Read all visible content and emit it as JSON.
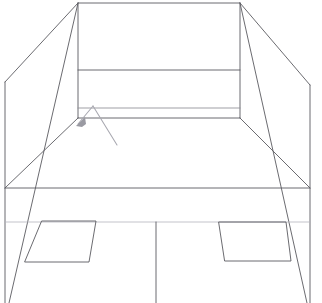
{
  "document": {
    "title": "Perspective Line Drawing",
    "kind": "line-art wireframe sketch",
    "subject": "interior room perspective box",
    "background_color": "#ffffff",
    "line_color": "#5a5a60",
    "faint_line_color": "#b4b4bc",
    "marker_color": "#9a9aa2",
    "canvas": {
      "width": 322,
      "height": 303
    }
  },
  "geometry": {
    "back_wall": {
      "name": "back-wall-rectangle",
      "x1": 78,
      "y1": 3,
      "x2": 240,
      "y2": 118,
      "horizontal_dividers_y": [
        70,
        108,
        118
      ]
    },
    "vanishing_lines": {
      "from_top_left_vertex": {
        "x": 78,
        "y": 3
      },
      "from_top_right_vertex": {
        "x": 240,
        "y": 3
      }
    },
    "left_side_wall": {
      "name": "left-side-wall",
      "outer_top": {
        "x": 5,
        "y": 82
      },
      "outer_bottom": {
        "x": 5,
        "y": 303
      },
      "floor_line_y": 188
    },
    "right_side_wall": {
      "name": "right-side-wall",
      "outer_top": {
        "x": 310,
        "y": 85
      },
      "outer_bottom": {
        "x": 310,
        "y": 303
      },
      "floor_line_y": 188
    },
    "floor_line": {
      "name": "floor-edge",
      "x1": 5,
      "y1": 188,
      "x2": 310,
      "y2": 188
    },
    "center_divider": {
      "name": "center-vertical-divider",
      "x": 156,
      "y1": 222,
      "y2": 303
    },
    "left_panel": {
      "name": "left-floor-panel",
      "points": "42,221 96,221 89,262 25,262"
    },
    "right_panel": {
      "name": "right-floor-panel",
      "points": "219,222 286,222 291,261 225,261"
    },
    "near_band_y": 222
  },
  "marker": {
    "name": "arrow-marker",
    "apex": {
      "x": 93,
      "y": 106
    },
    "left_leg_end": {
      "x": 78,
      "y": 124
    },
    "right_leg_end": {
      "x": 117,
      "y": 145
    },
    "head": {
      "x": 80,
      "y": 122
    }
  },
  "labels": {
    "alt_text": "Monochrome perspective line drawing of a rectangular room interior with a back wall, two side walls converging to the viewer, a floor, and a small arrow marker near the lower left of the back wall."
  }
}
